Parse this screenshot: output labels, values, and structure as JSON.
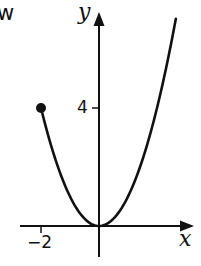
{
  "fragment_text": "w",
  "axes": {
    "x_label": "x",
    "y_label": "y",
    "x_tick_label": "−2",
    "y_tick_label": "4"
  },
  "colors": {
    "line": "#111111",
    "background": "#ffffff"
  },
  "chart_data": {
    "type": "line",
    "title": "",
    "xlabel": "x",
    "ylabel": "y",
    "function": "y = x^2, x >= -2",
    "endpoint": {
      "x": -2,
      "y": 4,
      "style": "closed-dot"
    },
    "series": [
      {
        "name": "y = x^2",
        "x": [
          -2,
          -1.5,
          -1,
          -0.5,
          0,
          0.5,
          1,
          1.5,
          2,
          2.5,
          2.65
        ],
        "y": [
          4,
          2.25,
          1,
          0.25,
          0,
          0.25,
          1,
          2.25,
          4,
          6.25,
          7.0
        ]
      }
    ],
    "x_ticks": [
      {
        "value": -2,
        "label": "−2"
      }
    ],
    "y_ticks": [
      {
        "value": 4,
        "label": "4"
      }
    ],
    "xlim": [
      -2.7,
      3.3
    ],
    "ylim": [
      -1,
      7.3
    ],
    "grid": false,
    "legend": null
  }
}
